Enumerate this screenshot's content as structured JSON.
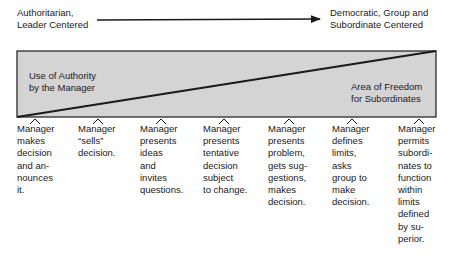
{
  "header": {
    "left_label": [
      "Authoritarian,",
      "Leader Centered"
    ],
    "right_label": [
      "Democratic, Group and",
      "Subordinate Centered"
    ]
  },
  "diagram": {
    "box_fill": "#d4d4d4",
    "line_color": "#1a1a1a",
    "upper_region_label": [
      "Use of Authority",
      "by the Manager"
    ],
    "lower_region_label": [
      "Area of Freedom",
      "for Subordinates"
    ]
  },
  "behaviors": [
    {
      "x": 17,
      "lines": [
        "Manager",
        "makes",
        "decision",
        "and an-",
        "nounces",
        "it."
      ]
    },
    {
      "x": 78,
      "lines": [
        "Manager",
        "“sells”",
        "decision."
      ]
    },
    {
      "x": 140,
      "lines": [
        "Manager",
        "presents",
        "ideas",
        "and",
        "invites",
        "questions."
      ]
    },
    {
      "x": 203,
      "lines": [
        "Manager",
        "presents",
        "tentative",
        "decision",
        "subject",
        "to change."
      ]
    },
    {
      "x": 268,
      "lines": [
        "Manager",
        "presents",
        "problem,",
        "gets sug-",
        "gestions,",
        "makes",
        "decision."
      ]
    },
    {
      "x": 332,
      "lines": [
        "Manager",
        "defines",
        "limits,",
        "asks",
        "group to",
        "make",
        "decision."
      ]
    },
    {
      "x": 398,
      "lines": [
        "Manager",
        "permits",
        "subordi-",
        "nates to",
        "function",
        "within",
        "limits",
        "defined",
        "by su-",
        "perior."
      ]
    }
  ]
}
